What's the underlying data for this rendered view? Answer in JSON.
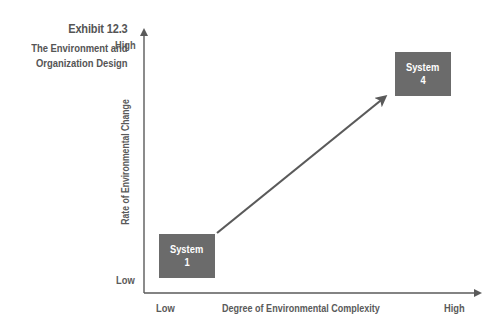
{
  "exhibit": {
    "number": "Exhibit 12.3",
    "title_line1": "The Environment and",
    "title_line2": "Organization Design"
  },
  "axes": {
    "y": {
      "title": "Rate of Environmental Change",
      "high_label": "High",
      "low_label": "Low"
    },
    "x": {
      "title": "Degree of Environmental Complexity",
      "low_label": "Low",
      "high_label": "High"
    }
  },
  "systems": [
    {
      "label_line1": "System",
      "label_line2": "1"
    },
    {
      "label_line1": "System",
      "label_line2": "4"
    }
  ],
  "colors": {
    "box_fill": "#6b6b6b",
    "axis_line": "#5a5a5a",
    "text": "#5a5a5a",
    "box_text": "#ffffff"
  }
}
